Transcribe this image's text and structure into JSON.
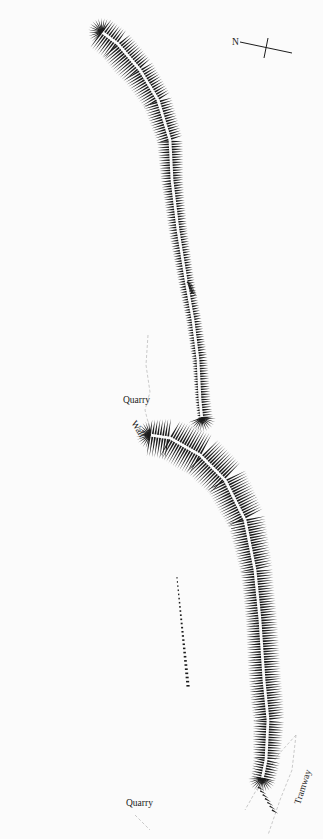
{
  "plan": {
    "background": "#fbfbfb",
    "ink": "#1c1c1c",
    "north_arrow": {
      "label": "N",
      "x": 282,
      "y": 47
    },
    "labels": [
      {
        "id": "quarry-upper",
        "text": "Quarry",
        "x": 123,
        "y": 403,
        "rotate": 0
      },
      {
        "id": "wall",
        "text": "Wall",
        "x": 131,
        "y": 423,
        "rotate": 58
      },
      {
        "id": "tramway",
        "text": "Tramway",
        "x": 296,
        "y": 800,
        "rotate": -72
      },
      {
        "id": "quarry-lower",
        "text": "Quarry",
        "x": 126,
        "y": 806,
        "rotate": 0
      }
    ],
    "earthworks": [
      {
        "id": "northern-bank",
        "spine": [
          [
            102,
            32
          ],
          [
            118,
            44
          ],
          [
            140,
            70
          ],
          [
            158,
            100
          ],
          [
            170,
            140
          ],
          [
            172,
            180
          ],
          [
            178,
            230
          ],
          [
            186,
            280
          ],
          [
            193,
            320
          ],
          [
            198,
            360
          ],
          [
            200,
            400
          ],
          [
            202,
            420
          ]
        ],
        "left_len": [
          18,
          20,
          16,
          13,
          11,
          9,
          8,
          7,
          6,
          5,
          4,
          3
        ],
        "right_len": [
          14,
          14,
          13,
          12,
          11,
          9,
          8,
          7,
          7,
          8,
          9,
          10
        ]
      },
      {
        "id": "southern-bank",
        "spine": [
          [
            150,
            435
          ],
          [
            170,
            438
          ],
          [
            200,
            455
          ],
          [
            225,
            480
          ],
          [
            245,
            520
          ],
          [
            255,
            570
          ],
          [
            260,
            620
          ],
          [
            264,
            680
          ],
          [
            268,
            720
          ],
          [
            266,
            760
          ],
          [
            262,
            780
          ]
        ],
        "left_len": [
          20,
          22,
          20,
          18,
          15,
          13,
          13,
          14,
          14,
          13,
          10
        ],
        "right_len": [
          14,
          22,
          22,
          20,
          18,
          16,
          16,
          16,
          16,
          14,
          12
        ]
      }
    ],
    "dotted_scarp": {
      "id": "outlying-scarp",
      "from": [
        177,
        577
      ],
      "to": [
        188,
        685
      ]
    },
    "small_hachures": [
      {
        "id": "upper-fragment",
        "from": [
          187,
          282
        ],
        "to": [
          191,
          292
        ]
      },
      {
        "id": "tramway-fragment",
        "from": [
          258,
          787
        ],
        "to": [
          272,
          810
        ]
      }
    ],
    "dashed_lines": [
      {
        "id": "quarry-edge-upper",
        "points": [
          [
            148,
            335
          ],
          [
            146,
            365
          ],
          [
            150,
            392
          ],
          [
            145,
            410
          ],
          [
            150,
            430
          ]
        ]
      },
      {
        "id": "tramway-line",
        "points": [
          [
            296,
            735
          ],
          [
            292,
            770
          ],
          [
            280,
            800
          ],
          [
            268,
            835
          ]
        ]
      },
      {
        "id": "tramway-edge",
        "points": [
          [
            296,
            735
          ],
          [
            278,
            755
          ],
          [
            262,
            780
          ],
          [
            245,
            810
          ]
        ]
      },
      {
        "id": "quarry-edge-lower",
        "points": [
          [
            135,
            815
          ],
          [
            142,
            822
          ],
          [
            150,
            830
          ]
        ]
      }
    ]
  }
}
